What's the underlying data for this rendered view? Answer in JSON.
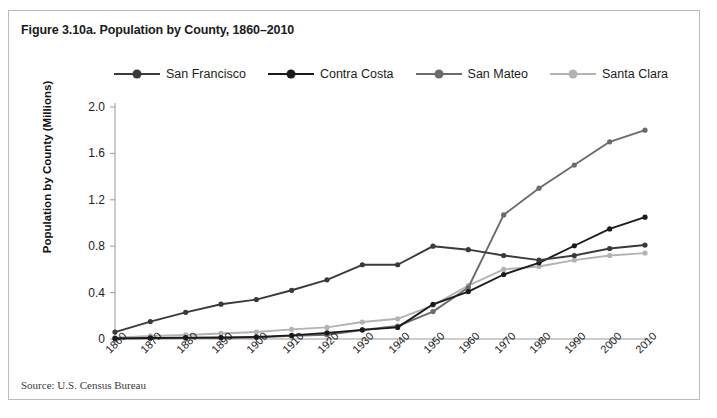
{
  "figure": {
    "title": "Figure 3.10a. Population by County, 1860–2010",
    "source": "Source: U.S. Census Bureau"
  },
  "chart_data": {
    "type": "line",
    "title": "Figure 3.10a. Population by County, 1860–2010",
    "xlabel": "",
    "ylabel": "Population by County (Millions)",
    "xlim": [
      1860,
      2010
    ],
    "ylim": [
      0,
      2.0
    ],
    "yticks": [
      0,
      0.4,
      0.8,
      1.2,
      1.6,
      2.0
    ],
    "ytick_labels": [
      "0",
      "0.4",
      "0.8",
      "1.2",
      "1.6",
      "2.0"
    ],
    "grid": false,
    "legend_position": "top",
    "categories": [
      1860,
      1870,
      1880,
      1890,
      1900,
      1910,
      1920,
      1930,
      1940,
      1950,
      1960,
      1970,
      1980,
      1990,
      2000,
      2010
    ],
    "xtick_labels": [
      "1860",
      "1870",
      "1880",
      "1890",
      "1900",
      "1910",
      "1920",
      "1930",
      "1940",
      "1950",
      "1960",
      "1970",
      "1980",
      "1990",
      "2000",
      "2010"
    ],
    "series": [
      {
        "name": "San Francisco",
        "color": "#3a3a3a",
        "values": [
          0.06,
          0.15,
          0.23,
          0.3,
          0.34,
          0.42,
          0.51,
          0.64,
          0.64,
          0.8,
          0.77,
          0.72,
          0.68,
          0.72,
          0.78,
          0.81
        ]
      },
      {
        "name": "Contra Costa",
        "color": "#1a1a1a",
        "values": [
          0.005,
          0.009,
          0.012,
          0.013,
          0.018,
          0.031,
          0.053,
          0.079,
          0.1,
          0.299,
          0.409,
          0.556,
          0.657,
          0.804,
          0.949,
          1.05
        ]
      },
      {
        "name": "San Mateo",
        "color": "#6b6b6b",
        "values": [
          0.003,
          0.006,
          0.009,
          0.01,
          0.012,
          0.027,
          0.037,
          0.078,
          0.112,
          0.236,
          0.444,
          1.07,
          1.3,
          1.5,
          1.7,
          1.8
        ]
      },
      {
        "name": "Santa Clara",
        "color": "#b3b3b3",
        "values": [
          0.011,
          0.027,
          0.035,
          0.048,
          0.06,
          0.083,
          0.1,
          0.146,
          0.174,
          0.29,
          0.46,
          0.6,
          0.625,
          0.68,
          0.72,
          0.74
        ]
      }
    ]
  }
}
